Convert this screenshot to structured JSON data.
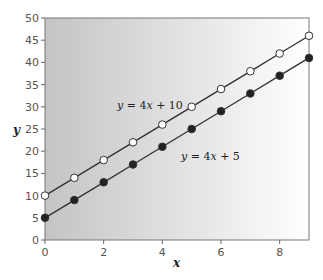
{
  "chart_data": {
    "type": "line",
    "title": "",
    "xlabel": "x",
    "ylabel": "y",
    "xlim": [
      0,
      9
    ],
    "ylim": [
      0,
      50
    ],
    "x_ticks": [
      0,
      2,
      4,
      6,
      8
    ],
    "y_ticks": [
      0,
      5,
      10,
      15,
      20,
      25,
      30,
      35,
      40,
      45,
      50
    ],
    "grid": false,
    "background": "gradient gray (left) to white (right)",
    "x": [
      0,
      1,
      2,
      3,
      4,
      5,
      6,
      7,
      8,
      9
    ],
    "series": [
      {
        "name": "y = 4x + 10",
        "marker": "open-circle",
        "values": [
          10,
          14,
          18,
          22,
          26,
          30,
          34,
          38,
          42,
          46
        ]
      },
      {
        "name": "y = 4x + 5",
        "marker": "filled-circle",
        "values": [
          5,
          9,
          13,
          17,
          21,
          25,
          29,
          33,
          37,
          41
        ]
      }
    ],
    "annotations": [
      {
        "text": "y = 4x + 10",
        "near_series": 0
      },
      {
        "text": "y = 4x + 5",
        "near_series": 1
      }
    ]
  },
  "labels": {
    "xlabel": "x",
    "ylabel": "y",
    "eq1": {
      "y": "y",
      "rest": " = 4",
      "x": "x",
      "tail": " + 10"
    },
    "eq2": {
      "y": "y",
      "rest": " = 4",
      "x": "x",
      "tail": " + 5"
    }
  },
  "colors": {
    "line": "#333333",
    "open_marker_fill": "#ffffff",
    "filled_marker_fill": "#222222",
    "axis": "#666666",
    "bg_left": "#c4c4c4",
    "bg_right": "#ffffff"
  }
}
